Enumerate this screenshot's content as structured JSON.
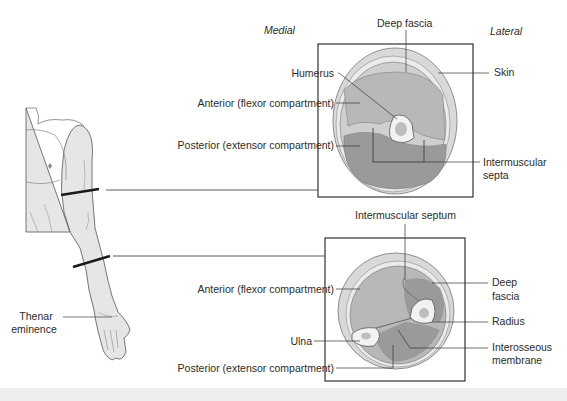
{
  "diagram": {
    "orientation": {
      "medial": "Medial",
      "lateral": "Lateral"
    },
    "upper_arm": {
      "labels": {
        "deep_fascia": "Deep fascia",
        "humerus": "Humerus",
        "skin": "Skin",
        "anterior": "Anterior (flexor compartment)",
        "posterior": "Posterior (extensor compartment)",
        "intermuscular_septa_line1": "Intermuscular",
        "intermuscular_septa_line2": "septa"
      }
    },
    "forearm": {
      "labels": {
        "intermuscular_septum": "Intermuscular septum",
        "anterior": "Anterior (flexor compartment)",
        "deep_fascia_line1": "Deep",
        "deep_fascia_line2": "fascia",
        "radius": "Radius",
        "ulna": "Ulna",
        "interosseous_line1": "Interosseous",
        "interosseous_line2": "membrane",
        "posterior": "Posterior (extensor compartment)"
      }
    },
    "figure": {
      "thenar_line1": "Thenar",
      "thenar_line2": "eminence"
    },
    "colors": {
      "skin": "#d9d9d9",
      "subcutaneous": "#ebebeb",
      "anterior_muscle": "#b8b8b8",
      "posterior_muscle": "#9a9a9a",
      "bone": "#f2f2f2",
      "marrow": "#bdbdbd",
      "body_fill": "#e6e6e6",
      "lines": "#333333"
    }
  }
}
